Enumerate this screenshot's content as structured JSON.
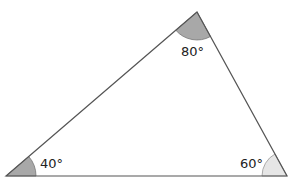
{
  "diagram": {
    "type": "triangle",
    "vertices": {
      "A": {
        "x": 6,
        "y": 176,
        "angle": "40°"
      },
      "B": {
        "x": 197,
        "y": 12,
        "angle": "80°"
      },
      "C": {
        "x": 287,
        "y": 176,
        "angle": "60°"
      }
    },
    "labels": {
      "angle_a": "40°",
      "angle_b": "80°",
      "angle_c": "60°"
    },
    "colors": {
      "stroke": "#555555",
      "fill_dark": "#a8a8a8",
      "fill_light": "#e6e6e6"
    }
  }
}
